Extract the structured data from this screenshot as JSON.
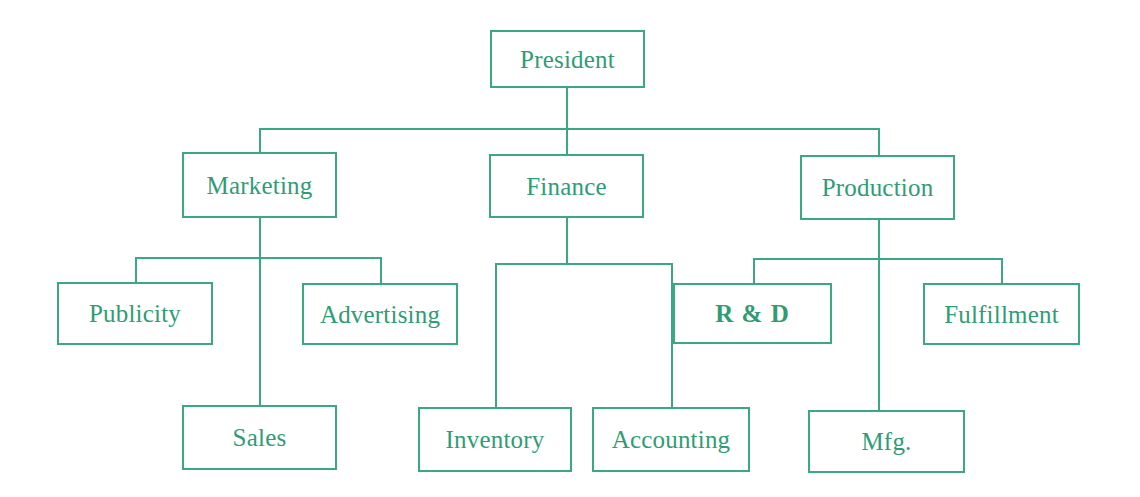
{
  "diagram": {
    "type": "organization-chart",
    "accent_color": "#3aa880",
    "text_color": "#2f9c74",
    "background_color": "#ffffff",
    "levels": 4
  },
  "nodes": {
    "president": {
      "label": "President",
      "level": 1,
      "x": 490,
      "y": 30,
      "w": 155,
      "h": 58
    },
    "marketing": {
      "label": "Marketing",
      "level": 2,
      "x": 182,
      "y": 152,
      "w": 155,
      "h": 66
    },
    "finance": {
      "label": "Finance",
      "level": 2,
      "x": 489,
      "y": 154,
      "w": 155,
      "h": 64
    },
    "production": {
      "label": "Production",
      "level": 2,
      "x": 800,
      "y": 155,
      "w": 155,
      "h": 65
    },
    "publicity": {
      "label": "Publicity",
      "level": 3,
      "x": 57,
      "y": 282,
      "w": 156,
      "h": 63
    },
    "advertising": {
      "label": "Advertising",
      "level": 3,
      "x": 302,
      "y": 283,
      "w": 156,
      "h": 62
    },
    "rnd": {
      "label": "R & D",
      "level": 3,
      "x": 673,
      "y": 283,
      "w": 159,
      "h": 61
    },
    "fulfillment": {
      "label": "Fulfillment",
      "level": 3,
      "x": 923,
      "y": 283,
      "w": 157,
      "h": 62
    },
    "sales": {
      "label": "Sales",
      "level": 4,
      "x": 182,
      "y": 405,
      "w": 155,
      "h": 65
    },
    "inventory": {
      "label": "Inventory",
      "level": 4,
      "x": 418,
      "y": 407,
      "w": 154,
      "h": 65
    },
    "accounting": {
      "label": "Accounting",
      "level": 4,
      "x": 592,
      "y": 407,
      "w": 158,
      "h": 65
    },
    "mfg": {
      "label": "Mfg.",
      "level": 4,
      "x": 808,
      "y": 410,
      "w": 157,
      "h": 63
    }
  },
  "edges": [
    {
      "from": "president",
      "to": "marketing"
    },
    {
      "from": "president",
      "to": "finance"
    },
    {
      "from": "president",
      "to": "production"
    },
    {
      "from": "marketing",
      "to": "publicity"
    },
    {
      "from": "marketing",
      "to": "advertising"
    },
    {
      "from": "marketing",
      "to": "sales"
    },
    {
      "from": "finance",
      "to": "inventory"
    },
    {
      "from": "finance",
      "to": "accounting"
    },
    {
      "from": "production",
      "to": "rnd"
    },
    {
      "from": "production",
      "to": "fulfillment"
    },
    {
      "from": "production",
      "to": "mfg"
    }
  ],
  "connectors": [
    {
      "name": "president-stem",
      "orient": "v",
      "x": 566,
      "y": 88,
      "len": 64
    },
    {
      "name": "president-bus",
      "orient": "h",
      "x": 259,
      "y": 128,
      "len": 619
    },
    {
      "name": "marketing-drop",
      "orient": "v",
      "x": 259,
      "y": 128,
      "len": 24
    },
    {
      "name": "finance-drop",
      "orient": "v",
      "x": 566,
      "y": 128,
      "len": 26
    },
    {
      "name": "production-drop",
      "orient": "v",
      "x": 878,
      "y": 128,
      "len": 27
    },
    {
      "name": "marketing-stem",
      "orient": "v",
      "x": 259,
      "y": 218,
      "len": 187
    },
    {
      "name": "marketing-bus",
      "orient": "h",
      "x": 135,
      "y": 257,
      "len": 245
    },
    {
      "name": "publicity-drop",
      "orient": "v",
      "x": 135,
      "y": 257,
      "len": 25
    },
    {
      "name": "advertising-drop",
      "orient": "v",
      "x": 380,
      "y": 257,
      "len": 26
    },
    {
      "name": "finance-stem",
      "orient": "v",
      "x": 566,
      "y": 218,
      "len": 45
    },
    {
      "name": "finance-bus",
      "orient": "h",
      "x": 495,
      "y": 263,
      "len": 176
    },
    {
      "name": "inventory-drop",
      "orient": "v",
      "x": 495,
      "y": 263,
      "len": 144
    },
    {
      "name": "accounting-drop",
      "orient": "v",
      "x": 671,
      "y": 263,
      "len": 144
    },
    {
      "name": "production-stem",
      "orient": "v",
      "x": 878,
      "y": 220,
      "len": 190
    },
    {
      "name": "production-bus",
      "orient": "h",
      "x": 753,
      "y": 258,
      "len": 250
    },
    {
      "name": "rnd-drop",
      "orient": "v",
      "x": 753,
      "y": 258,
      "len": 25
    },
    {
      "name": "fulfillment-drop",
      "orient": "v",
      "x": 1001,
      "y": 258,
      "len": 25
    }
  ]
}
